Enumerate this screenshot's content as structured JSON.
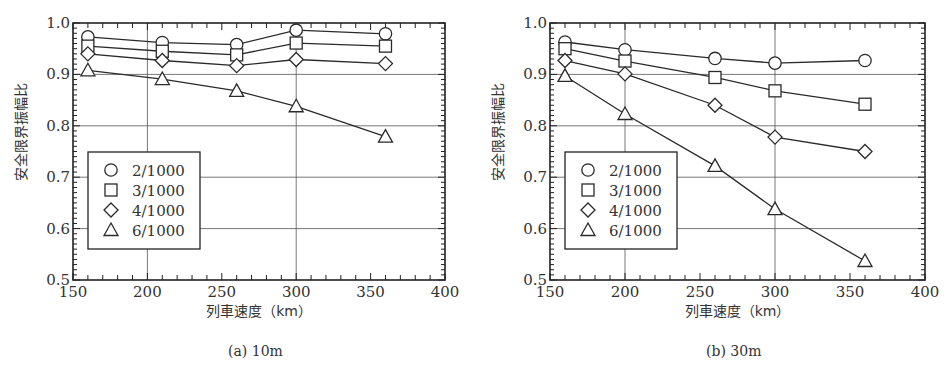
{
  "chart_data": [
    {
      "type": "line",
      "title": "",
      "caption": "(a)  10m",
      "xlabel": "列車速度（km）",
      "ylabel": "安全限界振幅比",
      "xlim": [
        150,
        400
      ],
      "ylim": [
        0.5,
        1.0
      ],
      "xticks": [
        150,
        200,
        250,
        300,
        350,
        400
      ],
      "yticks": [
        0.5,
        0.6,
        0.7,
        0.8,
        0.9,
        1.0
      ],
      "xtick_labels": [
        "150",
        "200",
        "250",
        "300",
        "350",
        "400"
      ],
      "ytick_labels": [
        "0.5",
        "0.6",
        "0.7",
        "0.8",
        "0.9",
        "1.0"
      ],
      "grid": true,
      "legend_position": "lower left",
      "x": [
        160,
        210,
        260,
        300,
        360
      ],
      "series": [
        {
          "name": "2/1000",
          "marker": "circle",
          "values": [
            0.973,
            0.962,
            0.958,
            0.986,
            0.979
          ]
        },
        {
          "name": "3/1000",
          "marker": "square",
          "values": [
            0.955,
            0.945,
            0.938,
            0.961,
            0.955
          ]
        },
        {
          "name": "4/1000",
          "marker": "diamond",
          "values": [
            0.94,
            0.927,
            0.917,
            0.929,
            0.921
          ]
        },
        {
          "name": "6/1000",
          "marker": "triangle",
          "values": [
            0.908,
            0.891,
            0.868,
            0.838,
            0.779
          ]
        }
      ]
    },
    {
      "type": "line",
      "title": "",
      "caption": "(b)  30m",
      "xlabel": "列車速度（km）",
      "ylabel": "安全限界振幅比",
      "xlim": [
        150,
        400
      ],
      "ylim": [
        0.5,
        1.0
      ],
      "xticks": [
        150,
        200,
        250,
        300,
        350,
        400
      ],
      "yticks": [
        0.5,
        0.6,
        0.7,
        0.8,
        0.9,
        1.0
      ],
      "xtick_labels": [
        "150",
        "200",
        "250",
        "300",
        "350",
        "400"
      ],
      "ytick_labels": [
        "0.5",
        "0.6",
        "0.7",
        "0.8",
        "0.9",
        "1.0"
      ],
      "grid": true,
      "legend_position": "lower left",
      "x": [
        160,
        200,
        260,
        300,
        360
      ],
      "series": [
        {
          "name": "2/1000",
          "marker": "circle",
          "values": [
            0.963,
            0.948,
            0.931,
            0.922,
            0.927
          ]
        },
        {
          "name": "3/1000",
          "marker": "square",
          "values": [
            0.95,
            0.926,
            0.894,
            0.868,
            0.842
          ]
        },
        {
          "name": "4/1000",
          "marker": "diamond",
          "values": [
            0.927,
            0.901,
            0.84,
            0.778,
            0.75
          ]
        },
        {
          "name": "6/1000",
          "marker": "triangle",
          "values": [
            0.897,
            0.823,
            0.722,
            0.638,
            0.537
          ]
        }
      ]
    }
  ],
  "layout": {
    "panels": [
      {
        "left": 73,
        "right": 445,
        "top": 23,
        "bottom": 280,
        "legend": {
          "x": 88,
          "y": 152,
          "w": 112,
          "h": 97
        },
        "caption_x": 228,
        "caption_y": 343,
        "ylabel_x": 26
      },
      {
        "left": 550,
        "right": 925,
        "top": 23,
        "bottom": 280,
        "legend": {
          "x": 565,
          "y": 152,
          "w": 112,
          "h": 97
        },
        "caption_x": 706,
        "caption_y": 343,
        "ylabel_x": 503
      }
    ],
    "colors": {
      "line": "#2a2a2a",
      "grid": "#555555",
      "axis": "#222222",
      "marker_fill": "#ffffff"
    }
  }
}
